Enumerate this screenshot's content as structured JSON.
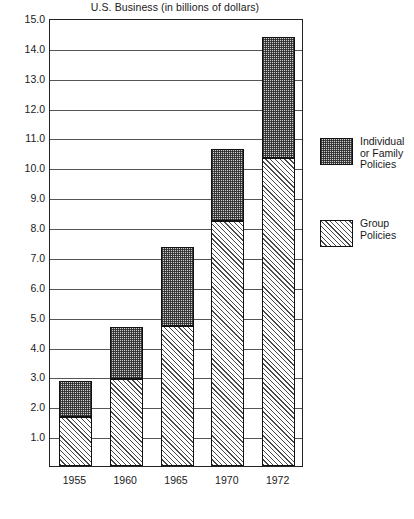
{
  "chart_data": {
    "type": "bar",
    "subtype": "stacked-vertical",
    "title": "U.S. Business (in billions of dollars)",
    "xlabel": "",
    "ylabel": "",
    "ylim": [
      0,
      15.0
    ],
    "ytick_step": 1.0,
    "grid": true,
    "legend_position": "right",
    "categories": [
      "1955",
      "1960",
      "1965",
      "1970",
      "1972"
    ],
    "ytick_labels": [
      "1.0",
      "2.0",
      "3.0",
      "4.0",
      "5.0",
      "6.0",
      "7.0",
      "8.0",
      "9.0",
      "10.0",
      "11.0",
      "12.0",
      "13.0",
      "14.0",
      "15.0"
    ],
    "ytick_values": [
      1.0,
      2.0,
      3.0,
      4.0,
      5.0,
      6.0,
      7.0,
      8.0,
      9.0,
      10.0,
      11.0,
      12.0,
      13.0,
      14.0,
      15.0
    ],
    "series": [
      {
        "name": "Group Policies",
        "fill": "diagonal-hatch",
        "values": [
          1.65,
          2.9,
          4.7,
          8.2,
          10.3
        ]
      },
      {
        "name": "Individual or Family Policies",
        "fill": "stipple-dot",
        "values": [
          1.2,
          1.75,
          2.65,
          2.4,
          4.05
        ]
      }
    ],
    "totals": [
      2.85,
      4.65,
      7.35,
      10.6,
      14.35
    ]
  },
  "legend": {
    "entries": [
      {
        "label": "Individual\nor Family\nPolicies",
        "swatch": "stipple-dot"
      },
      {
        "label": "Group\nPolicies",
        "swatch": "diagonal-hatch"
      }
    ]
  },
  "colors": {
    "axis": "#222222",
    "gridline": "#555555",
    "individual_fill": "#cfcfcf",
    "group_fill": "#ffffff",
    "text": "#1a1a1a"
  }
}
